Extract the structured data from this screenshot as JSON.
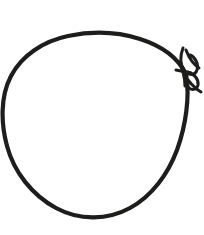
{
  "image": {
    "kind": "line-drawing",
    "subject": "rope-loop-with-knot",
    "description": "A single closed loop of cord or rope drawn in black ink on a plain white background, tied off with a small knot and bow at the right side.",
    "width": 204,
    "height": 235,
    "background_color": "#ffffff",
    "ink_color": "#1d1d1b",
    "stroke_width_px": 4.2,
    "stroke_width_thin_px": 3.0,
    "clipped_edges": [
      "left"
    ]
  },
  "elements": {
    "loop": {
      "name": "main-loop",
      "label": "Rope loop",
      "bounds": {
        "x": 1,
        "y": 32,
        "width": 190,
        "height": 186
      },
      "top_point": {
        "x": 88,
        "y": 33
      },
      "bottom_point": {
        "x": 84,
        "y": 217
      },
      "left_point": {
        "x": 3,
        "y": 128
      },
      "right_point": {
        "x": 186,
        "y": 74
      },
      "path": "M 186,74 C 178,58 162,46 140,39 C 118,32 92,31 68,36 C 44,41 22,55 11,76 C 0,97 1,124 7,146 C 14,172 32,195 56,208 C 80,221 108,220 130,208 C 152,196 168,174 177,150 C 186,125 190,96 186,74 Z"
    },
    "knot": {
      "name": "knot",
      "label": "Knot",
      "center": {
        "x": 186,
        "y": 74
      },
      "bounds": {
        "x": 172,
        "y": 46,
        "width": 32,
        "height": 44
      }
    },
    "bow_loop_upper": {
      "name": "bow-upper-loop",
      "label": "Upper bow loop",
      "path": "M 183,48 C 180,56 180,64 184,70 C 188,76 195,76 197,70 C 199,64 195,57 190,55"
    },
    "bow_loop_lower": {
      "name": "bow-lower-loop",
      "label": "Lower bow loop",
      "path": "M 188,72 C 194,74 199,79 198,85 C 197,90 191,91 188,87 C 185,83 185,77 187,73"
    },
    "tail_upper": {
      "name": "rope-tail-upper",
      "label": "Upper rope tail",
      "path": "M 186,50 C 189,58 193,64 199,68"
    },
    "tail_lower": {
      "name": "rope-tail-lower",
      "label": "Lower rope tail",
      "path": "M 188,80 C 192,85 196,89 201,92"
    },
    "cinch": {
      "name": "knot-cinch",
      "label": "Knot cinch",
      "path": "M 176,70 C 181,71 186,72 191,73"
    },
    "cross_strand": {
      "name": "crossing-strand",
      "label": "Crossing strand",
      "path": "M 179,62 C 183,70 185,78 185,86"
    }
  }
}
